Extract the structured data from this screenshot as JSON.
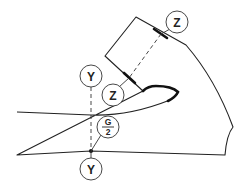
{
  "diagram": {
    "labels": {
      "z_top": "Z",
      "z_bottom": "Z",
      "y_top": "Y",
      "y_bottom": "Y",
      "gap_numerator": "G",
      "gap_denominator": "2"
    },
    "colors": {
      "line": "#222222",
      "background": "#ffffff"
    }
  }
}
